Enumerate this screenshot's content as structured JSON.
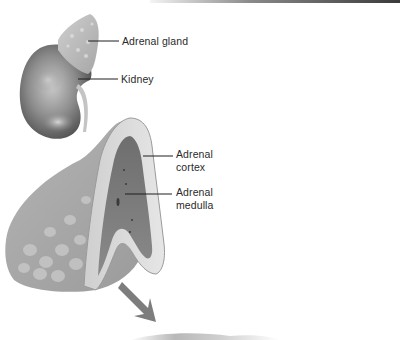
{
  "figure": {
    "labels": {
      "adrenal_gland": "Adrenal gland",
      "kidney": "Kidney",
      "cortex_line1": "Adrenal",
      "cortex_line2": "cortex",
      "medulla_line1": "Adrenal",
      "medulla_line2": "medulla"
    },
    "icons": {
      "arrow": "arrow-down-right-icon"
    },
    "colors": {
      "background": "#ffffff",
      "tissue_light": "#d9d9d9",
      "tissue_mid": "#a8a8a8",
      "tissue_dark": "#5e5e5e",
      "leader_line": "#1e1e1e",
      "arrow": "#7d7d7d"
    }
  }
}
